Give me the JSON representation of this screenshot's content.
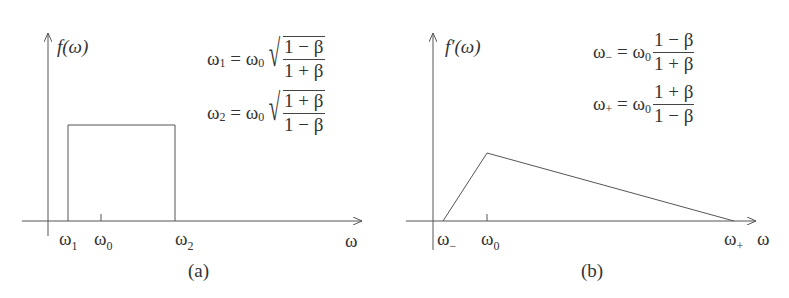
{
  "panels": [
    {
      "id": "a",
      "caption": "(a)",
      "y_label": "f(ω)",
      "x_label": "ω",
      "ticks": [
        {
          "base": "ω",
          "sub": "1"
        },
        {
          "base": "ω",
          "sub": "0"
        },
        {
          "base": "ω",
          "sub": "2"
        }
      ],
      "equations": [
        {
          "lhs": "ω",
          "lhs_sub": "1",
          "eq": " = ω",
          "eq_sub": "0",
          "num": "1 − β",
          "den": "1 + β",
          "sqrt": true
        },
        {
          "lhs": "ω",
          "lhs_sub": "2",
          "eq": " = ω",
          "eq_sub": "0",
          "num": "1 + β",
          "den": "1 − β",
          "sqrt": true
        }
      ]
    },
    {
      "id": "b",
      "caption": "(b)",
      "y_label": "f′(ω)",
      "x_label": "ω",
      "ticks": [
        {
          "base": "ω",
          "sub": "−"
        },
        {
          "base": "ω",
          "sub": "0"
        },
        {
          "base": "ω",
          "sub": "+"
        }
      ],
      "equations": [
        {
          "lhs": "ω",
          "lhs_sub": "−",
          "eq": " = ω",
          "eq_sub": "0",
          "num": "1 − β",
          "den": "1 + β",
          "sqrt": false
        },
        {
          "lhs": "ω",
          "lhs_sub": "+",
          "eq": " = ω",
          "eq_sub": "0",
          "num": "1 + β",
          "den": "1 − β",
          "sqrt": false
        }
      ]
    }
  ],
  "colors": {
    "line": "#555555",
    "text": "#333333"
  }
}
